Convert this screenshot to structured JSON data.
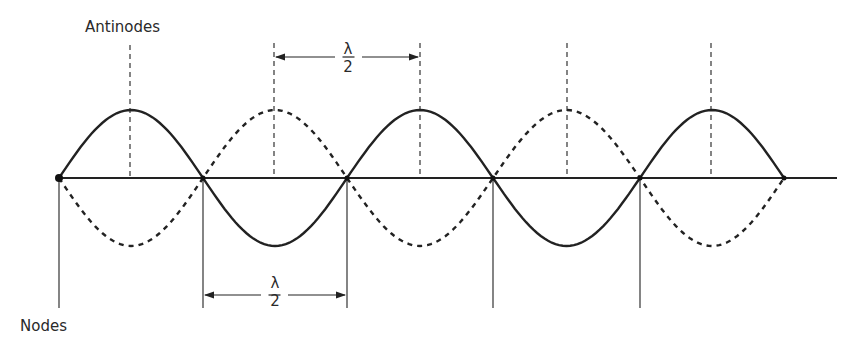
{
  "labels": {
    "antinodes": "Antinodes",
    "nodes": "Nodes",
    "top_dimension": {
      "numerator": "λ",
      "denominator": "2"
    },
    "bottom_dimension": {
      "numerator": "λ",
      "denominator": "2"
    }
  },
  "geometry": {
    "axis_y": 178,
    "axis_x_start": 59,
    "axis_x_end": 837,
    "amplitude_px": 68,
    "node_x": [
      59,
      203,
      347,
      493,
      640,
      784
    ],
    "antinode_x": [
      130,
      274,
      420,
      567,
      711
    ]
  },
  "colors": {
    "line": "#222222",
    "background": "#ffffff"
  }
}
